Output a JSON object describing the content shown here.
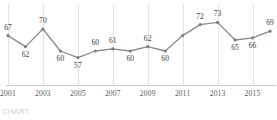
{
  "chart_data": {
    "type": "line",
    "title": "",
    "subtitle": "",
    "xlabel": "",
    "ylabel": "",
    "grid": "vertical-only",
    "legend": "none",
    "xlim": [
      2001,
      2016
    ],
    "ylim": [
      55,
      75
    ],
    "x": [
      2001,
      2002,
      2003,
      2004,
      2005,
      2006,
      2007,
      2008,
      2009,
      2010,
      2011,
      2012,
      2013,
      2014,
      2015,
      2016
    ],
    "values": [
      67,
      62,
      70,
      60,
      57,
      60,
      61,
      60,
      62,
      60,
      67,
      72,
      73,
      65,
      66,
      69
    ],
    "point_labels": [
      "67",
      "62",
      "70",
      "60",
      "57",
      "60",
      "61",
      "60",
      "62",
      "60",
      "",
      "72",
      "73",
      "65",
      "66",
      "69"
    ],
    "label_positions": [
      "above",
      "below",
      "above",
      "below",
      "below",
      "above",
      "above",
      "below",
      "above",
      "below",
      "none",
      "above",
      "above",
      "below",
      "below",
      "above"
    ],
    "tick_labels": [
      "2001",
      "2003",
      "2005",
      "2007",
      "2009",
      "2011",
      "2013",
      "2015"
    ],
    "tick_x": [
      2001,
      2003,
      2005,
      2007,
      2009,
      2011,
      2013,
      2015
    ],
    "series_name": "",
    "line_color": "#8a8a8a",
    "marker_color": "#7d7d7d",
    "grid_color": "#e3e3e3",
    "axis_color": "#c9c9c9",
    "label_color": "#3b3b3b",
    "tick_color": "#575757"
  },
  "footnote": {
    "text": "CHART"
  }
}
